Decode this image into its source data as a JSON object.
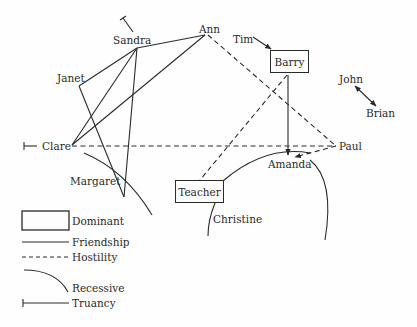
{
  "diagram": {
    "type": "sociogram",
    "nodes": {
      "sandra": "Sandra",
      "ann": "Ann",
      "tim": "Tim",
      "barry": "Barry",
      "janet": "Janet",
      "john": "John",
      "brian": "Brian",
      "clare": "Clare",
      "paul": "Paul",
      "amanda": "Amanda",
      "margaret": "Margaret",
      "teacher": "Teacher",
      "christine": "Christine"
    },
    "dominant_nodes": [
      "Barry",
      "Teacher"
    ],
    "recessive_nodes": [
      "Margaret",
      "Amanda",
      "Christine"
    ],
    "truancy_nodes": [
      "Sandra",
      "Clare"
    ],
    "edges": [
      {
        "from": "Sandra",
        "to": "Ann",
        "type": "friendship"
      },
      {
        "from": "Sandra",
        "to": "Janet",
        "type": "friendship"
      },
      {
        "from": "Sandra",
        "to": "Clare",
        "type": "friendship"
      },
      {
        "from": "Sandra",
        "to": "Margaret",
        "type": "friendship"
      },
      {
        "from": "Ann",
        "to": "Clare",
        "type": "friendship"
      },
      {
        "from": "Janet",
        "to": "Margaret",
        "type": "friendship"
      },
      {
        "from": "Ann",
        "to": "Paul",
        "type": "hostility"
      },
      {
        "from": "Clare",
        "to": "Paul",
        "type": "hostility"
      },
      {
        "from": "Barry",
        "to": "Teacher",
        "type": "hostility"
      },
      {
        "from": "Paul",
        "to": "Amanda",
        "type": "hostility",
        "directed": true
      },
      {
        "from": "Barry",
        "to": "Amanda",
        "type": "friendship",
        "directed": true
      },
      {
        "from": "Tim",
        "to": "Barry",
        "type": "friendship",
        "directed": true
      },
      {
        "from": "John",
        "to": "Brian",
        "type": "friendship",
        "directed": "both"
      }
    ]
  },
  "legend": {
    "dominant": "Dominant",
    "friendship": "Friendship",
    "hostility": "Hostility",
    "recessive": "Recessive",
    "truancy": "Truancy"
  },
  "colors": {
    "ink": "#2a2a2a",
    "background": "#fefefe"
  }
}
